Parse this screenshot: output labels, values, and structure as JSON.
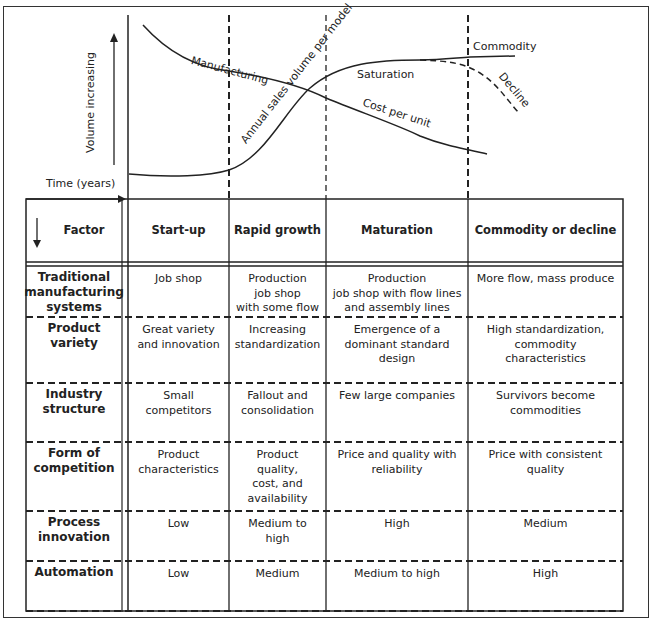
{
  "chart": {
    "y_axis_label": "Volume increasing",
    "x_axis_label": "Time (years)",
    "curves": {
      "manufacturing": "Manufacturing",
      "annual_sales": "Annual sales volume per model",
      "saturation": "Saturation",
      "cost_per_unit": "Cost per unit",
      "commodity": "Commodity",
      "decline": "Decline"
    }
  },
  "table": {
    "header": {
      "factor": "Factor",
      "columns": [
        "Start-up",
        "Rapid growth",
        "Maturation",
        "Commodity or decline"
      ]
    },
    "rows": [
      {
        "factor": [
          "Traditional",
          "manufacturing",
          "systems"
        ],
        "cells": [
          [
            "Job shop"
          ],
          [
            "Production",
            "job shop",
            "with some flow"
          ],
          [
            "Production",
            "job shop with flow lines",
            "and assembly lines"
          ],
          [
            "More flow, mass produce"
          ]
        ]
      },
      {
        "factor": [
          "Product",
          "variety"
        ],
        "cells": [
          [
            "Great variety",
            "and innovation"
          ],
          [
            "Increasing",
            "standardization"
          ],
          [
            "Emergence of a",
            "dominant standard",
            "design"
          ],
          [
            "High standardization,",
            "commodity",
            "characteristics"
          ]
        ]
      },
      {
        "factor": [
          "Industry",
          "structure"
        ],
        "cells": [
          [
            "Small",
            "competitors"
          ],
          [
            "Fallout and",
            "consolidation"
          ],
          [
            "Few large companies"
          ],
          [
            "Survivors become",
            "commodities"
          ]
        ]
      },
      {
        "factor": [
          "Form of",
          "competition"
        ],
        "cells": [
          [
            "Product",
            "characteristics"
          ],
          [
            "Product",
            "quality,",
            "cost, and",
            "availability"
          ],
          [
            "Price and quality with",
            "reliability"
          ],
          [
            "Price with consistent",
            "quality"
          ]
        ]
      },
      {
        "factor": [
          "Process",
          "innovation"
        ],
        "cells": [
          [
            "Low"
          ],
          [
            "Medium to",
            "high"
          ],
          [
            "High"
          ],
          [
            "Medium"
          ]
        ]
      },
      {
        "factor": [
          "Automation"
        ],
        "cells": [
          [
            "Low"
          ],
          [
            "Medium"
          ],
          [
            "Medium to high"
          ],
          [
            "High"
          ]
        ]
      }
    ]
  }
}
